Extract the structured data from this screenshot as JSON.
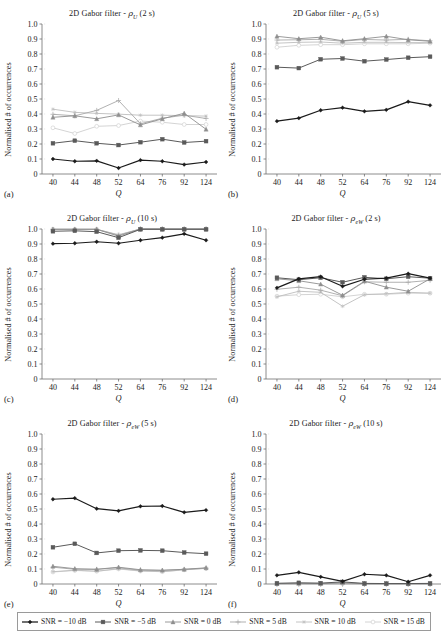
{
  "figure": {
    "width": 448,
    "height": 641,
    "x_categories": [
      "40",
      "44",
      "48",
      "52",
      "64",
      "76",
      "92",
      "124"
    ],
    "y_ticks": [
      "0",
      "0.1",
      "0.2",
      "0.3",
      "0.4",
      "0.5",
      "0.6",
      "0.7",
      "0.8",
      "0.9",
      "1.0"
    ],
    "ylabel": "Normalised # of occurrences",
    "xlabel": "Q",
    "ylim": [
      0,
      1.0
    ]
  },
  "series_style": [
    {
      "name": "SNR = −10 dB",
      "color": "#1b1b1b",
      "marker": "diamond",
      "width": 1.25
    },
    {
      "name": "SNR = −5 dB",
      "color": "#5a5a5a",
      "marker": "square",
      "width": 1.0
    },
    {
      "name": "SNR = 0 dB",
      "color": "#8f8f8f",
      "marker": "triangle",
      "width": 0.9
    },
    {
      "name": "SNR = 5 dB",
      "color": "#a8a8a8",
      "marker": "cross",
      "width": 0.9
    },
    {
      "name": "SNR = 10 dB",
      "color": "#bdbdbd",
      "marker": "star",
      "width": 0.9
    },
    {
      "name": "SNR = 15 dB",
      "color": "#cfcfcf",
      "marker": "circle",
      "width": 0.9
    }
  ],
  "legend": {
    "items": [
      {
        "label": "SNR = −10 dB"
      },
      {
        "label": "SNR = −5 dB"
      },
      {
        "label": "SNR = 0 dB"
      },
      {
        "label": "SNR = 5 dB"
      },
      {
        "label": "SNR = 10 dB"
      },
      {
        "label": "SNR = 15 dB"
      }
    ]
  },
  "panels": [
    {
      "letter": "(a)",
      "title_prefix": "2D Gabor filter - ",
      "title_symbol": "ρ",
      "title_sub": "U",
      "title_suffix": " (2 s)",
      "title_plain": "2D Gabor filter - ρU (2 s)",
      "chart_data": {
        "type": "line",
        "title": "2D Gabor filter - ρU (2 s)",
        "xlabel": "Q",
        "ylabel": "Normalised # of occurrences",
        "categories": [
          "40",
          "44",
          "48",
          "52",
          "64",
          "76",
          "92",
          "124"
        ],
        "ylim": [
          0,
          1.0
        ],
        "grid": false,
        "legend_position": "bottom",
        "series": [
          {
            "name": "SNR = −10 dB",
            "values": [
              0.1,
              0.085,
              0.088,
              0.04,
              0.092,
              0.085,
              0.063,
              0.08
            ]
          },
          {
            "name": "SNR = −5 dB",
            "values": [
              0.205,
              0.222,
              0.205,
              0.193,
              0.212,
              0.232,
              0.21,
              0.219
            ]
          },
          {
            "name": "SNR = 0 dB",
            "values": [
              0.378,
              0.388,
              0.368,
              0.394,
              0.327,
              0.368,
              0.405,
              0.298
            ]
          },
          {
            "name": "SNR = 5 dB",
            "values": [
              0.398,
              0.388,
              0.424,
              0.49,
              0.335,
              0.372,
              0.392,
              0.37
            ]
          },
          {
            "name": "SNR = 10 dB",
            "values": [
              0.432,
              0.411,
              0.404,
              0.399,
              0.392,
              0.392,
              0.389,
              0.386
            ]
          },
          {
            "name": "SNR = 15 dB",
            "values": [
              0.308,
              0.27,
              0.318,
              0.323,
              0.353,
              0.345,
              0.33,
              0.33
            ]
          }
        ]
      }
    },
    {
      "letter": "(b)",
      "title_prefix": "2D Gabor filter - ",
      "title_symbol": "ρ",
      "title_sub": "U",
      "title_suffix": " (5 s)",
      "title_plain": "2D Gabor filter - ρU (5 s)",
      "chart_data": {
        "type": "line",
        "title": "2D Gabor filter - ρU (5 s)",
        "xlabel": "Q",
        "ylabel": "Normalised # of occurrences",
        "categories": [
          "40",
          "44",
          "48",
          "52",
          "64",
          "76",
          "92",
          "124"
        ],
        "ylim": [
          0,
          1.0
        ],
        "grid": false,
        "legend_position": "bottom",
        "series": [
          {
            "name": "SNR = −10 dB",
            "values": [
              0.352,
              0.372,
              0.425,
              0.442,
              0.418,
              0.428,
              0.482,
              0.458
            ]
          },
          {
            "name": "SNR = −5 dB",
            "values": [
              0.712,
              0.706,
              0.765,
              0.77,
              0.752,
              0.763,
              0.775,
              0.782
            ]
          },
          {
            "name": "SNR = 0 dB",
            "values": [
              0.918,
              0.902,
              0.912,
              0.888,
              0.902,
              0.918,
              0.895,
              0.885
            ]
          },
          {
            "name": "SNR = 5 dB",
            "values": [
              0.893,
              0.895,
              0.898,
              0.885,
              0.897,
              0.893,
              0.898,
              0.888
            ]
          },
          {
            "name": "SNR = 10 dB",
            "values": [
              0.872,
              0.878,
              0.88,
              0.872,
              0.878,
              0.878,
              0.876,
              0.876
            ]
          },
          {
            "name": "SNR = 15 dB",
            "values": [
              0.845,
              0.858,
              0.862,
              0.862,
              0.868,
              0.868,
              0.868,
              0.872
            ]
          }
        ]
      }
    },
    {
      "letter": "(c)",
      "title_prefix": "2D Gabor filter - ",
      "title_symbol": "ρ",
      "title_sub": "U",
      "title_suffix": " (10 s)",
      "title_plain": "2D Gabor filter - ρU (10 s)",
      "chart_data": {
        "type": "line",
        "title": "2D Gabor filter - ρU (10 s)",
        "xlabel": "Q",
        "ylabel": "Normalised # of occurrences",
        "categories": [
          "40",
          "44",
          "48",
          "52",
          "64",
          "76",
          "92",
          "124"
        ],
        "ylim": [
          0,
          1.0
        ],
        "grid": false,
        "legend_position": "bottom",
        "series": [
          {
            "name": "SNR = −10 dB",
            "values": [
              0.902,
              0.905,
              0.915,
              0.905,
              0.925,
              0.942,
              0.968,
              0.925
            ]
          },
          {
            "name": "SNR = −5 dB",
            "values": [
              0.985,
              0.988,
              0.982,
              0.942,
              0.998,
              0.998,
              0.998,
              0.998
            ]
          },
          {
            "name": "SNR = 0 dB",
            "values": [
              0.998,
              0.998,
              0.998,
              0.952,
              1.0,
              1.0,
              1.0,
              1.0
            ]
          },
          {
            "name": "SNR = 5 dB",
            "values": [
              0.998,
              0.998,
              0.998,
              0.958,
              1.0,
              1.0,
              1.0,
              1.0
            ]
          },
          {
            "name": "SNR = 10 dB",
            "values": [
              0.998,
              0.998,
              0.998,
              0.96,
              1.0,
              1.0,
              1.0,
              1.0
            ]
          },
          {
            "name": "SNR = 15 dB",
            "values": [
              0.998,
              0.998,
              0.998,
              0.962,
              1.0,
              1.0,
              1.0,
              1.0
            ]
          }
        ]
      }
    },
    {
      "letter": "(d)",
      "title_prefix": "2D Gabor filter - ",
      "title_symbol": "ρ",
      "title_sub": "eW",
      "title_suffix": " (2 s)",
      "title_plain": "2D Gabor filter - ρeW (2 s)",
      "chart_data": {
        "type": "line",
        "title": "2D Gabor filter - ρeW (2 s)",
        "xlabel": "Q",
        "ylabel": "Normalised # of occurrences",
        "categories": [
          "40",
          "44",
          "48",
          "52",
          "64",
          "76",
          "92",
          "124"
        ],
        "ylim": [
          0,
          1.0
        ],
        "grid": false,
        "legend_position": "bottom",
        "series": [
          {
            "name": "SNR = −10 dB",
            "values": [
              0.608,
              0.668,
              0.682,
              0.618,
              0.665,
              0.672,
              0.702,
              0.672
            ]
          },
          {
            "name": "SNR = −5 dB",
            "values": [
              0.675,
              0.662,
              0.675,
              0.645,
              0.678,
              0.668,
              0.682,
              0.672
            ]
          },
          {
            "name": "SNR = 0 dB",
            "values": [
              0.668,
              0.655,
              0.632,
              0.558,
              0.652,
              0.612,
              0.585,
              0.668
            ]
          },
          {
            "name": "SNR = 5 dB",
            "values": [
              0.598,
              0.612,
              0.592,
              0.555,
              0.648,
              0.645,
              0.645,
              0.658
            ]
          },
          {
            "name": "SNR = 10 dB",
            "values": [
              0.548,
              0.585,
              0.578,
              0.485,
              0.562,
              0.568,
              0.578,
              0.572
            ]
          },
          {
            "name": "SNR = 15 dB",
            "values": [
              0.552,
              0.562,
              0.565,
              0.548,
              0.565,
              0.565,
              0.572,
              0.572
            ]
          }
        ]
      }
    },
    {
      "letter": "(e)",
      "title_prefix": "2D Gabor filter - ",
      "title_symbol": "ρ",
      "title_sub": "eW",
      "title_suffix": " (5 s)",
      "title_plain": "2D Gabor filter - ρeW (5 s)",
      "chart_data": {
        "type": "line",
        "title": "2D Gabor filter - ρeW (5 s)",
        "xlabel": "Q",
        "ylabel": "Normalised # of occurrences",
        "categories": [
          "40",
          "44",
          "48",
          "52",
          "64",
          "76",
          "92",
          "124"
        ],
        "ylim": [
          0,
          1.0
        ],
        "grid": false,
        "legend_position": "bottom",
        "series": [
          {
            "name": "SNR = −10 dB",
            "values": [
              0.565,
              0.572,
              0.502,
              0.488,
              0.518,
              0.52,
              0.478,
              0.492
            ]
          },
          {
            "name": "SNR = −5 dB",
            "values": [
              0.245,
              0.268,
              0.207,
              0.222,
              0.224,
              0.222,
              0.21,
              0.202
            ]
          },
          {
            "name": "SNR = 0 dB",
            "values": [
              0.118,
              0.102,
              0.098,
              0.112,
              0.095,
              0.092,
              0.098,
              0.108
            ]
          },
          {
            "name": "SNR = 5 dB",
            "values": [
              0.112,
              0.098,
              0.098,
              0.108,
              0.092,
              0.09,
              0.098,
              0.105
            ]
          },
          {
            "name": "SNR = 10 dB",
            "values": [
              0.082,
              0.092,
              0.085,
              0.102,
              0.088,
              0.082,
              0.095,
              0.105
            ]
          },
          {
            "name": "SNR = 15 dB",
            "values": [
              0.08,
              0.09,
              0.085,
              0.1,
              0.086,
              0.082,
              0.094,
              0.104
            ]
          }
        ]
      }
    },
    {
      "letter": "(f)",
      "title_prefix": "2D Gabor filter - ",
      "title_symbol": "ρ",
      "title_sub": "eW",
      "title_suffix": " (10 s)",
      "title_plain": "2D Gabor filter - ρeW (10 s)",
      "chart_data": {
        "type": "line",
        "title": "2D Gabor filter - ρeW (10 s)",
        "xlabel": "Q",
        "ylabel": "Normalised # of occurrences",
        "categories": [
          "40",
          "44",
          "48",
          "52",
          "64",
          "76",
          "92",
          "124"
        ],
        "ylim": [
          0,
          1.0
        ],
        "grid": false,
        "legend_position": "bottom",
        "series": [
          {
            "name": "SNR = −10 dB",
            "values": [
              0.058,
              0.078,
              0.048,
              0.018,
              0.065,
              0.058,
              0.015,
              0.058
            ]
          },
          {
            "name": "SNR = −5 dB",
            "values": [
              0.005,
              0.008,
              0.006,
              0.014,
              0.004,
              0.003,
              0.003,
              0.004
            ]
          },
          {
            "name": "SNR = 0 dB",
            "values": [
              0.003,
              0.004,
              0.003,
              0.008,
              0.002,
              0.002,
              0.002,
              0.002
            ]
          },
          {
            "name": "SNR = 5 dB",
            "values": [
              0.002,
              0.003,
              0.002,
              0.006,
              0.002,
              0.002,
              0.002,
              0.002
            ]
          },
          {
            "name": "SNR = 10 dB",
            "values": [
              0.002,
              0.002,
              0.002,
              0.004,
              0.001,
              0.001,
              0.001,
              0.001
            ]
          },
          {
            "name": "SNR = 15 dB",
            "values": [
              0.001,
              0.002,
              0.002,
              0.003,
              0.001,
              0.001,
              0.001,
              0.001
            ]
          }
        ]
      }
    }
  ]
}
